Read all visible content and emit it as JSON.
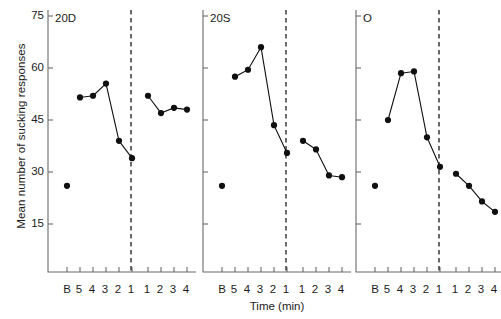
{
  "chart_data": {
    "type": "line",
    "title": "",
    "xlabel": "Time (min)",
    "ylabel": "Mean number of sucking responses",
    "ylim": [
      0,
      75
    ],
    "yticks": [
      15,
      30,
      45,
      60,
      75
    ],
    "ytick_labels": [
      "15",
      "30",
      "45",
      "60",
      "75"
    ],
    "xtick_labels": [
      "B",
      "5",
      "4",
      "3",
      "2",
      "1",
      "1",
      "2",
      "3",
      "4"
    ],
    "grid": false,
    "legend": null,
    "divider": {
      "style": "dashed",
      "after_category_index": 5,
      "label": ""
    },
    "panels": [
      {
        "name": "20D",
        "baseline": {
          "label": "B",
          "value": 26
        },
        "pre": {
          "categories": [
            "5",
            "4",
            "3",
            "2",
            "1"
          ],
          "values": [
            51.5,
            52,
            55.5,
            39,
            34
          ]
        },
        "post": {
          "categories": [
            "1",
            "2",
            "3",
            "4"
          ],
          "values": [
            52,
            47,
            48.5,
            48
          ]
        }
      },
      {
        "name": "20S",
        "baseline": {
          "label": "B",
          "value": 26
        },
        "pre": {
          "categories": [
            "5",
            "4",
            "3",
            "2",
            "1"
          ],
          "values": [
            57.5,
            59.5,
            66,
            43.5,
            35.5
          ]
        },
        "post": {
          "categories": [
            "1",
            "2",
            "3",
            "4"
          ],
          "values": [
            39,
            36.5,
            29,
            28.5
          ]
        }
      },
      {
        "name": "O",
        "baseline": {
          "label": "B",
          "value": 26
        },
        "pre": {
          "categories": [
            "5",
            "4",
            "3",
            "2",
            "1"
          ],
          "values": [
            45,
            58.5,
            59,
            40,
            31.5
          ]
        },
        "post": {
          "categories": [
            "1",
            "2",
            "3",
            "4"
          ],
          "values": [
            29.5,
            26,
            21.5,
            18.5
          ]
        }
      }
    ]
  },
  "panel_titles": {
    "p0": "20D",
    "p1": "20S",
    "p2": "O"
  },
  "axis": {
    "ylabel": "Mean number of sucking responses",
    "xlabel": "Time (min)",
    "y0": "15",
    "y1": "30",
    "y2": "45",
    "y3": "60",
    "y4": "75",
    "x0": "B",
    "x1": "5",
    "x2": "4",
    "x3": "3",
    "x4": "2",
    "x5": "1",
    "x6": "1",
    "x7": "2",
    "x8": "3",
    "x9": "4"
  },
  "style": {
    "marker_color": "#101010",
    "line_color": "#101010",
    "axis_color": "#6a6a6a",
    "divider_color": "#2b2b2b"
  }
}
